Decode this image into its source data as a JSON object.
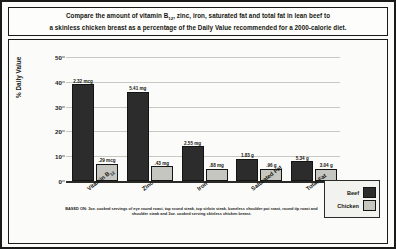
{
  "title": {
    "line1_a": "Compare the amount of vitamin B",
    "line1_sub": "12",
    "line1_b": ", zinc, iron, saturated fat and total fat in lean beef to",
    "line2": "a skinless chicken breast as a percentage of the Daily Value recommended for a 2000-calorie diet."
  },
  "legend": {
    "beef_label": "Beef",
    "chicken_label": "Chicken"
  },
  "footnote": "BASED ON: 3oz. cooked servings of eye round roast, top round steak, top sirloin steak, boneless shoulder pot roast, round tip roast and shoulder steak and 3oz. cooked serving skinless chicken breast.",
  "colors": {
    "beef": "#2c2c2c",
    "chicken": "#c6c6c0",
    "frame": "#1a1a1a",
    "grid": "#c9c9c4"
  },
  "chart_data": {
    "type": "bar",
    "title": "Compare the amount of vitamin B12, zinc, iron, saturated fat and total fat in lean beef to a skinless chicken breast as a percentage of the Daily Value recommended for a 2000-calorie diet.",
    "xlabel": "",
    "ylabel": "% Daily Value",
    "ylim": [
      0,
      50
    ],
    "yticks": [
      0,
      10,
      20,
      30,
      40,
      50
    ],
    "grid": true,
    "legend_position": "right",
    "categories": [
      "Vitamin B12",
      "Zinc",
      "Iron",
      "Saturated Fat",
      "Total Fat"
    ],
    "category_labels": [
      {
        "text": "Vitamin B",
        "sub": "12"
      },
      {
        "text": "Zinc",
        "sub": ""
      },
      {
        "text": "Iron",
        "sub": ""
      },
      {
        "text": "Saturated Fat",
        "sub": ""
      },
      {
        "text": "Total Fat",
        "sub": ""
      }
    ],
    "series": [
      {
        "name": "Beef",
        "color": "#2c2c2c",
        "values": [
          39,
          36,
          14,
          9,
          8
        ],
        "point_labels": [
          "2.32 mcg",
          "5.41 mg",
          "2.55 mg",
          "1.83 g",
          "5.34 g"
        ]
      },
      {
        "name": "Chicken",
        "color": "#c6c6c0",
        "values": [
          7,
          6,
          5,
          5,
          5
        ],
        "point_labels": [
          ".29 mcg",
          ".43 mg",
          ".88 mg",
          ".96 g",
          "3.04 g"
        ]
      }
    ]
  }
}
